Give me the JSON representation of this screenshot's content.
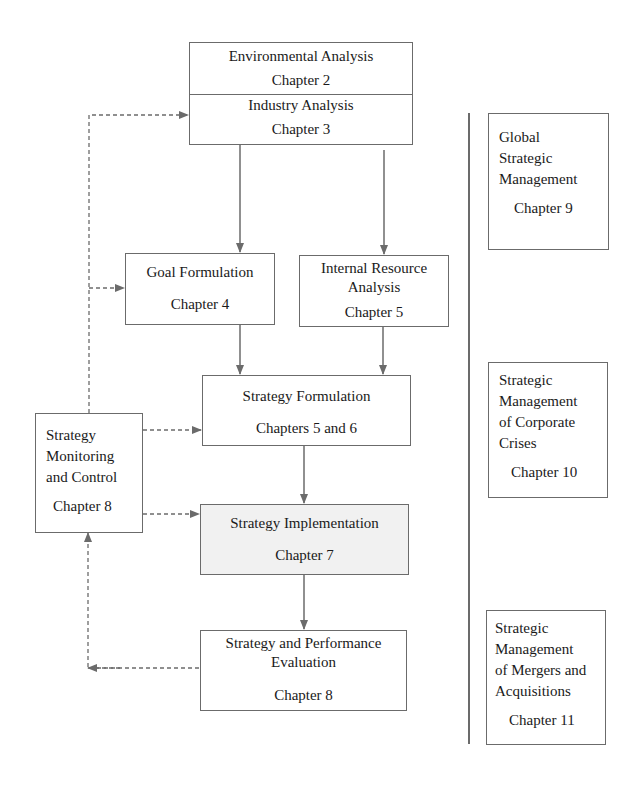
{
  "diagram": {
    "main_flow": {
      "environmental_analysis": {
        "title": "Environmental Analysis",
        "chapter": "Chapter 2"
      },
      "industry_analysis": {
        "title": "Industry Analysis",
        "chapter": "Chapter 3"
      },
      "goal_formulation": {
        "title": "Goal Formulation",
        "chapter": "Chapter 4"
      },
      "internal_resource_analysis": {
        "title_line1": "Internal Resource",
        "title_line2": "Analysis",
        "chapter": "Chapter 5"
      },
      "strategy_formulation": {
        "title": "Strategy Formulation",
        "chapter": "Chapters 5 and 6"
      },
      "strategy_implementation": {
        "title": "Strategy Implementation",
        "chapter": "Chapter 7"
      },
      "strategy_evaluation": {
        "title_line1": "Strategy and Performance",
        "title_line2": "Evaluation",
        "chapter": "Chapter 8"
      },
      "strategy_monitoring": {
        "title_line1": "Strategy",
        "title_line2": "Monitoring",
        "title_line3": "and Control",
        "chapter": "Chapter 8"
      }
    },
    "side_topics": [
      {
        "lines": [
          "Global",
          "Strategic",
          "Management"
        ],
        "chapter": "Chapter 9"
      },
      {
        "lines": [
          "Strategic",
          "Management",
          "of Corporate",
          "Crises"
        ],
        "chapter": "Chapter 10"
      },
      {
        "lines": [
          "Strategic",
          "Management",
          "of Mergers and",
          "Acquisitions"
        ],
        "chapter": "Chapter 11"
      }
    ],
    "colors": {
      "line": "#6b6b6b",
      "shaded_fill": "#f1f1f1"
    }
  }
}
